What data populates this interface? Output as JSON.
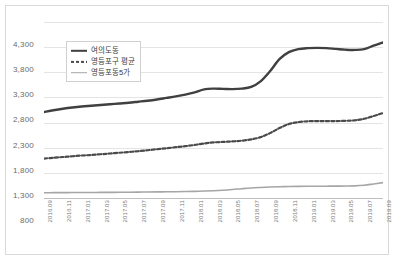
{
  "chart_data": {
    "type": "line",
    "title": "",
    "xlabel": "",
    "ylabel": "",
    "ylim": [
      800,
      4300
    ],
    "yticks": [
      "4,300",
      "3,800",
      "3,300",
      "2,800",
      "2,300",
      "1,800",
      "1,300",
      "800"
    ],
    "ytick_values": [
      4300,
      3800,
      3300,
      2800,
      2300,
      1800,
      1300,
      800
    ],
    "grid": true,
    "legend_position": "upper-left-inside",
    "categories": [
      "2016.09",
      "2016.10",
      "2016.11",
      "2016.12",
      "2017.01",
      "2017.02",
      "2017.03",
      "2017.04",
      "2017.05",
      "2017.06",
      "2017.07",
      "2017.08",
      "2017.09",
      "2017.10",
      "2017.11",
      "2017.12",
      "2018.01",
      "2018.02",
      "2018.03",
      "2018.04",
      "2018.05",
      "2018.06",
      "2018.07",
      "2018.08",
      "2018.09",
      "2018.10",
      "2018.11",
      "2018.12",
      "2019.01",
      "2019.02",
      "2019.03",
      "2019.04",
      "2019.05",
      "2019.06",
      "2019.07",
      "2019.08",
      "2019.09"
    ],
    "xtick_labels": [
      "2016.09",
      "2016.11",
      "2017.01",
      "2017.03",
      "2017.05",
      "2017.07",
      "2017.09",
      "2017.11",
      "2018.01",
      "2018.03",
      "2018.05",
      "2018.07",
      "2018.09",
      "2018.11",
      "2019.01",
      "2019.03",
      "2019.05",
      "2019.07",
      "2019.09"
    ],
    "series": [
      {
        "name": "여의도동",
        "style": "solid",
        "color": "#404040",
        "width": 2.4,
        "values": [
          2510,
          2545,
          2575,
          2600,
          2620,
          2635,
          2650,
          2665,
          2680,
          2695,
          2715,
          2735,
          2760,
          2790,
          2820,
          2855,
          2900,
          2960,
          2975,
          2970,
          2965,
          2975,
          3010,
          3120,
          3320,
          3560,
          3700,
          3760,
          3780,
          3785,
          3780,
          3765,
          3750,
          3745,
          3760,
          3830,
          3895
        ]
      },
      {
        "name": "영등포구 평균",
        "style": "dotted",
        "color": "#4a4a4a",
        "width": 2.2,
        "values": [
          1585,
          1600,
          1615,
          1630,
          1645,
          1655,
          1670,
          1685,
          1700,
          1715,
          1730,
          1750,
          1770,
          1790,
          1810,
          1830,
          1855,
          1885,
          1905,
          1915,
          1925,
          1940,
          1965,
          2010,
          2090,
          2190,
          2270,
          2310,
          2325,
          2330,
          2330,
          2330,
          2335,
          2345,
          2375,
          2430,
          2490
        ]
      },
      {
        "name": "영등포동5가",
        "style": "solid",
        "color": "#a6a6a6",
        "width": 1.6,
        "values": [
          905,
          906,
          907,
          908,
          909,
          910,
          911,
          912,
          913,
          915,
          917,
          919,
          921,
          923,
          925,
          928,
          932,
          938,
          945,
          955,
          968,
          985,
          1000,
          1010,
          1018,
          1024,
          1028,
          1031,
          1033,
          1034,
          1035,
          1036,
          1038,
          1042,
          1055,
          1080,
          1105
        ]
      }
    ]
  },
  "legend": {
    "items": [
      {
        "label": "여의도동"
      },
      {
        "label": "영등포구 평균"
      },
      {
        "label": "영등포동5가"
      }
    ]
  }
}
